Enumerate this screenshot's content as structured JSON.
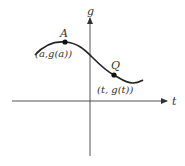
{
  "diagram": {
    "axes": {
      "x_label": "t",
      "y_label": "g"
    },
    "points": [
      {
        "name": "A",
        "coord_label": "(a,g(a))"
      },
      {
        "name": "Q",
        "coord_label": "(t, g(t))"
      }
    ],
    "colors": {
      "curve": "#222222",
      "axis": "#555555",
      "text": "#333333"
    }
  }
}
